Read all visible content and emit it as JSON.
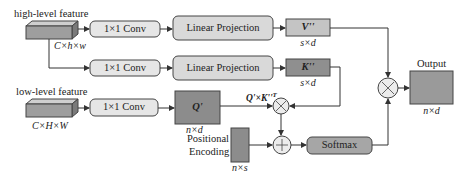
{
  "high_feature": {
    "label": "high-level feature",
    "dims": "C×h×w"
  },
  "low_feature": {
    "label": "low-level feature",
    "dims": "C×H×W"
  },
  "conv": {
    "label": "1×1 Conv"
  },
  "linear": {
    "label": "Linear Projection"
  },
  "v": {
    "label": "V''",
    "dims": "s×d"
  },
  "k": {
    "label": "K''",
    "dims": "s×d"
  },
  "q": {
    "label": "Q'",
    "dims": "n×d"
  },
  "qk": {
    "label": "Q'×K''",
    "sup": "T"
  },
  "pos": {
    "label1": "Positional",
    "label2": "Encoding",
    "dims": "n×s"
  },
  "softmax": {
    "label": "Softmax"
  },
  "output": {
    "label": "Output",
    "dims": "n×d"
  },
  "colors": {
    "light_box": "#dedede",
    "mid_box": "#bdbdbd",
    "dark_box": "#8c8c8c",
    "stroke": "#444444"
  }
}
